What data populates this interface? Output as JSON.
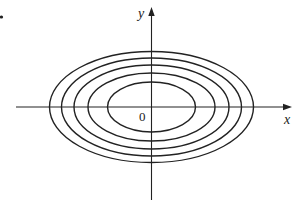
{
  "figure": {
    "width": 296,
    "height": 203,
    "background": "#ffffff",
    "stroke_color": "#222222",
    "center": {
      "x": 151.5,
      "y": 107
    },
    "x_axis": {
      "x1": 16,
      "x2": 286,
      "arrow_tip": 292,
      "label": "x",
      "label_pos": {
        "x": 284,
        "y": 124
      }
    },
    "y_axis": {
      "y1": 200,
      "y2": 15,
      "arrow_tip": 7,
      "label": "y",
      "label_pos": {
        "x": 138,
        "y": 18
      }
    },
    "origin_label": {
      "text": "0",
      "x": 139,
      "y": 121
    },
    "bullet_dot": {
      "x": 1.5,
      "y": 17,
      "r": 1.6
    },
    "ellipses": [
      {
        "rx": 44,
        "ry": 25
      },
      {
        "rx": 63.5,
        "ry": 34
      },
      {
        "rx": 77.5,
        "ry": 42
      },
      {
        "rx": 90,
        "ry": 49
      },
      {
        "rx": 102,
        "ry": 55.5
      }
    ]
  }
}
